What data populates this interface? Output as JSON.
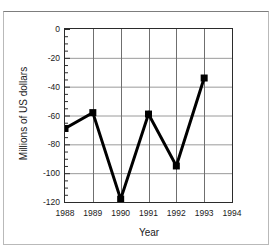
{
  "chart_data": {
    "type": "line",
    "title": "",
    "xlabel": "Year",
    "ylabel": "Millions of US dollars",
    "x": [
      1988,
      1989,
      1990,
      1991,
      1992,
      1993
    ],
    "values": [
      -69,
      -58,
      -118,
      -59,
      -95,
      -34
    ],
    "series": [
      {
        "name": "Balance",
        "values": [
          -69,
          -58,
          -118,
          -59,
          -95,
          -34
        ]
      }
    ],
    "xlim": [
      1988,
      1994
    ],
    "ylim": [
      -120,
      0
    ],
    "ytick_labels": [
      "0",
      "-20",
      "-40",
      "-60",
      "-80",
      "-100",
      "-120"
    ],
    "ytick_values": [
      0,
      -20,
      -40,
      -60,
      -80,
      -100,
      -120
    ],
    "xtick_labels": [
      "1988",
      "1989",
      "1990",
      "1991",
      "1992",
      "1993",
      "1994"
    ],
    "xtick_values": [
      1988,
      1989,
      1990,
      1991,
      1992,
      1993,
      1994
    ],
    "y_minor_step": 5,
    "grid": true,
    "grid_color": "#9a9a9a",
    "legend": "none",
    "marker": "filled-square",
    "line_color": "#000000",
    "line_width": 3,
    "frame_color": "#2b2b2b"
  }
}
